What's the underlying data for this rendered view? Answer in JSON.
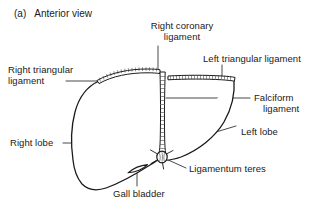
{
  "figure": {
    "caption_index": "(a)",
    "caption_text": "Anterior view",
    "style": "black-and-white line drawing",
    "ink_color": "#1a1a1a",
    "fill_color": "#ffffff"
  },
  "labels": {
    "right_coronary_ligament": "Right coronary\nligament",
    "right_coronary_ligament_line1": "Right coronary",
    "right_coronary_ligament_line2": "ligament",
    "right_triangular_ligament_line1": "Right triangular",
    "right_triangular_ligament_line2": "ligament",
    "left_triangular_ligament": "Left triangular ligament",
    "falciform_ligament_line1": "Falciform",
    "falciform_ligament_line2": "ligament",
    "left_lobe": "Left lobe",
    "right_lobe": "Right lobe",
    "ligamentum_teres": "Ligamentum teres",
    "gall_bladder": "Gall bladder"
  }
}
